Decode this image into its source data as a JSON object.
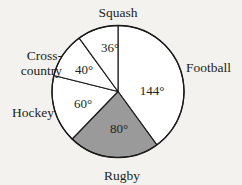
{
  "background_color": "#f4f2ef",
  "chart_data": {
    "type": "pie",
    "title": "",
    "subtitle": "",
    "xlabel": "",
    "ylabel": "",
    "legend_position": "none",
    "grid": false,
    "units": "degrees",
    "total_degrees": 360,
    "start_angle_deg": 0,
    "direction": "clockwise",
    "categories": [
      "Football",
      "Rugby",
      "Hockey",
      "Cross-country",
      "Squash"
    ],
    "values": [
      144,
      80,
      60,
      40,
      36
    ],
    "data_labels": [
      "144°",
      "80°",
      "60°",
      "40°",
      "36°"
    ],
    "slices": [
      {
        "name": "Football",
        "label": "Football",
        "value": 144,
        "data_label": "144°",
        "fill": "#ffffff",
        "stroke": "#1a1a1a",
        "start_deg": 0,
        "end_deg": 144,
        "label_position": "right-outside"
      },
      {
        "name": "Rugby",
        "label": "Rugby",
        "value": 80,
        "data_label": "80°",
        "fill": "#9a9a9a",
        "stroke": "#1a1a1a",
        "start_deg": 144,
        "end_deg": 224,
        "label_position": "bottom-outside"
      },
      {
        "name": "Hockey",
        "label": "Hockey",
        "value": 60,
        "data_label": "60°",
        "fill": "#ffffff",
        "stroke": "#1a1a1a",
        "start_deg": 224,
        "end_deg": 284,
        "label_position": "left-outside"
      },
      {
        "name": "Cross-country",
        "label": "Cross-",
        "label_line2": "country",
        "value": 40,
        "data_label": "40°",
        "fill": "#ffffff",
        "stroke": "#1a1a1a",
        "start_deg": 284,
        "end_deg": 324,
        "label_position": "upper-left-outside"
      },
      {
        "name": "Squash",
        "label": "Squash",
        "value": 36,
        "data_label": "36°",
        "fill": "#ffffff",
        "stroke": "#1a1a1a",
        "start_deg": 324,
        "end_deg": 360,
        "label_position": "top-outside"
      }
    ]
  },
  "labels": {
    "squash": "Squash",
    "football": "Football",
    "cross_country_line1": "Cross-",
    "cross_country_line2": "country",
    "hockey": "Hockey",
    "rugby": "Rugby"
  },
  "angles": {
    "squash": "36°",
    "football": "144°",
    "cross_country": "40°",
    "hockey": "60°",
    "rugby": "80°"
  }
}
